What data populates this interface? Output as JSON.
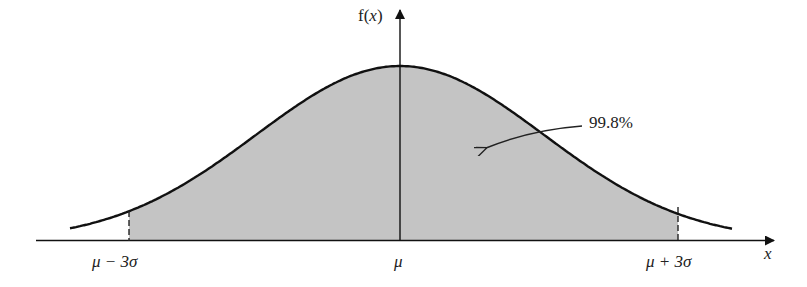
{
  "chart_data": {
    "type": "area",
    "title": "",
    "xlabel": "x",
    "ylabel": "f(x)",
    "distribution": "normal",
    "mean_label": "μ",
    "shaded_region": {
      "from": "μ − 3σ",
      "to": "μ + 3σ",
      "percent": 99.8
    },
    "x_tick_labels": [
      "μ − 3σ",
      "μ",
      "μ + 3σ"
    ],
    "annotation": "99.8%",
    "grid": false,
    "colors": {
      "fill": "#c4c4c4",
      "line": "#111111"
    }
  },
  "labels": {
    "y_axis": "f(",
    "y_axis_var": "x",
    "y_axis_close": ")",
    "x_axis": "x",
    "left_tick": "μ − 3σ",
    "center_tick": "μ",
    "right_tick": "μ + 3σ",
    "annotation": "99.8%"
  }
}
